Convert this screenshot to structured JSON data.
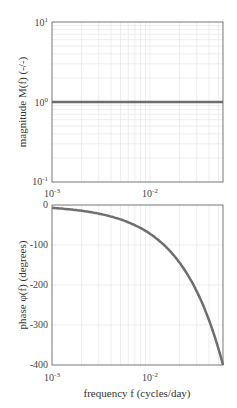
{
  "chart_data": [
    {
      "type": "line",
      "title": "",
      "xlabel": "",
      "ylabel": "magnitude M(f) (-/-)",
      "xscale": "log",
      "yscale": "log",
      "xlim": [
        0.001,
        0.0556
      ],
      "ylim": [
        0.1,
        10
      ],
      "x_ticks": [
        "10^-3",
        "10^-2"
      ],
      "y_ticks": [
        "10^-1",
        "10^0",
        "10^1"
      ],
      "grid": true,
      "series": [
        {
          "name": "magnitude",
          "x": [
            0.001,
            0.002,
            0.005,
            0.01,
            0.02,
            0.05,
            0.0556
          ],
          "values": [
            1,
            1,
            1,
            1,
            1,
            1,
            1
          ]
        }
      ]
    },
    {
      "type": "line",
      "title": "",
      "xlabel": "frequency f (cycles/day)",
      "ylabel": "phase φ(f) (degrees)",
      "xscale": "log",
      "yscale": "linear",
      "xlim": [
        0.001,
        0.0556
      ],
      "ylim": [
        -400,
        0
      ],
      "x_ticks": [
        "10^-3",
        "10^-2"
      ],
      "y_ticks": [
        "0",
        "-100",
        "-200",
        "-300",
        "-400"
      ],
      "grid": true,
      "series": [
        {
          "name": "phase",
          "x": [
            0.001,
            0.002,
            0.005,
            0.01,
            0.02,
            0.03,
            0.04,
            0.05,
            0.0556
          ],
          "values": [
            -7.2,
            -14.4,
            -36,
            -72,
            -144,
            -216,
            -288,
            -360,
            -400
          ]
        }
      ]
    }
  ],
  "labels": {
    "top_ylabel": "magnitude M(f) (-/-)",
    "bottom_ylabel": "phase φ(f) (degrees)",
    "xlabel": "frequency f (cycles/day)",
    "top_yticks": [
      "10",
      "10",
      "10"
    ],
    "top_yexp": [
      "1",
      "0",
      "-1"
    ],
    "bottom_yticks": [
      "0",
      "-100",
      "-200",
      "-300",
      "-400"
    ],
    "xticks": [
      "10",
      "10"
    ],
    "xexp": [
      "-3",
      "-2"
    ]
  },
  "colors": {
    "line": "#6e6e6e",
    "grid": "#e3e3e3",
    "axis": "#555555"
  }
}
